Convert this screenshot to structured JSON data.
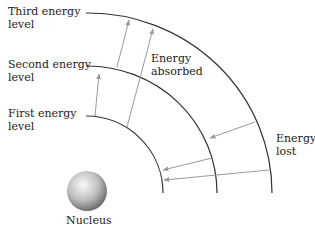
{
  "diagram": {
    "levels": [
      {
        "id": "first",
        "label_line1": "First energy",
        "label_line2": "level",
        "radius": 77
      },
      {
        "id": "second",
        "label_line1": "Second energy",
        "label_line2": "level",
        "radius": 130
      },
      {
        "id": "third",
        "label_line1": "Third energy",
        "label_line2": "level",
        "radius": 180
      }
    ],
    "absorbed_label_line1": "Energy",
    "absorbed_label_line2": "absorbed",
    "lost_label_line1": "Energy",
    "lost_label_line2": "lost",
    "nucleus_label": "Nucleus",
    "colors": {
      "arc": "#333333",
      "arrow": "#999999",
      "nucleus_light": "#f5f5f5",
      "nucleus_dark": "#7a7a7a"
    }
  }
}
